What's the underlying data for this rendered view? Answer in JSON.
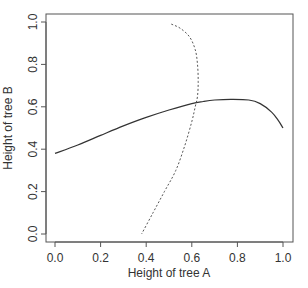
{
  "chart_data": {
    "type": "line",
    "title": "",
    "xlabel": "Height of tree A",
    "ylabel": "Height of tree B",
    "xlim": [
      0,
      1
    ],
    "ylim": [
      0,
      1
    ],
    "grid": false,
    "legend": null,
    "x_ticks": [
      "0.0",
      "0.2",
      "0.4",
      "0.6",
      "0.8",
      "1.0"
    ],
    "y_ticks": [
      "0.0",
      "0.2",
      "0.4",
      "0.6",
      "0.8",
      "1.0"
    ],
    "series": [
      {
        "name": "solid",
        "style": "solid",
        "color": "#333333",
        "points": [
          [
            0.0,
            0.38
          ],
          [
            0.1,
            0.42
          ],
          [
            0.2,
            0.465
          ],
          [
            0.3,
            0.51
          ],
          [
            0.4,
            0.55
          ],
          [
            0.5,
            0.585
          ],
          [
            0.6,
            0.615
          ],
          [
            0.65,
            0.625
          ],
          [
            0.7,
            0.632
          ],
          [
            0.77,
            0.635
          ],
          [
            0.85,
            0.632
          ],
          [
            0.9,
            0.615
          ],
          [
            0.95,
            0.575
          ],
          [
            0.98,
            0.535
          ],
          [
            1.0,
            0.5
          ]
        ]
      },
      {
        "name": "dashed",
        "style": "dashed",
        "color": "#555555",
        "points": [
          [
            0.51,
            0.99
          ],
          [
            0.55,
            0.97
          ],
          [
            0.59,
            0.93
          ],
          [
            0.615,
            0.87
          ],
          [
            0.625,
            0.8
          ],
          [
            0.628,
            0.72
          ],
          [
            0.625,
            0.65
          ],
          [
            0.615,
            0.6
          ],
          [
            0.6,
            0.53
          ],
          [
            0.57,
            0.42
          ],
          [
            0.53,
            0.3
          ],
          [
            0.48,
            0.2
          ],
          [
            0.43,
            0.1
          ],
          [
            0.38,
            0.0
          ]
        ]
      }
    ]
  }
}
